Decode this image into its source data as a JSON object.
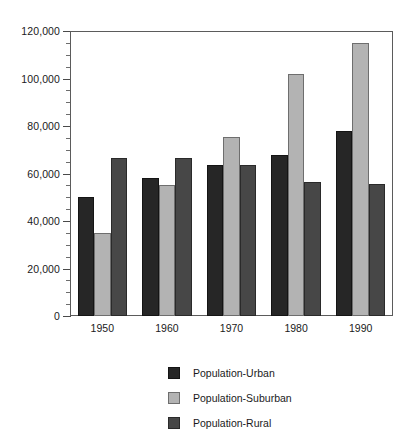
{
  "chart_data": {
    "type": "bar",
    "title": "",
    "subtitle": "",
    "xlabel": "",
    "ylabel": "",
    "categories": [
      "1950",
      "1960",
      "1970",
      "1980",
      "1990"
    ],
    "series": [
      {
        "name": "Population-Urban",
        "color": "#262626",
        "values": [
          50000,
          58000,
          63500,
          68000,
          78000
        ]
      },
      {
        "name": "Population-Suburban",
        "color": "#b3b3b3",
        "values": [
          35000,
          55000,
          75500,
          102000,
          115000
        ]
      },
      {
        "name": "Population-Rural",
        "color": "#474747",
        "values": [
          66500,
          66500,
          63500,
          56500,
          55500
        ]
      }
    ],
    "ylim": [
      0,
      120000
    ],
    "y_major_ticks": [
      0,
      20000,
      40000,
      60000,
      80000,
      100000,
      120000
    ],
    "y_tick_labels": [
      "0",
      "20,000",
      "40,000",
      "60,000",
      "80,000",
      "100,000",
      "120,000"
    ],
    "y_minor_interval": 5000,
    "grid": false,
    "legend_position": "bottom",
    "frame": true
  },
  "legend": {
    "items": [
      {
        "label": "Population-Urban",
        "swatch": "urban"
      },
      {
        "label": "Population-Suburban",
        "swatch": "suburban"
      },
      {
        "label": "Population-Rural",
        "swatch": "rural"
      }
    ]
  }
}
